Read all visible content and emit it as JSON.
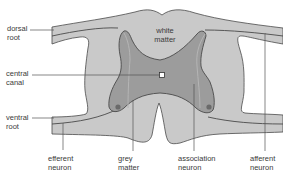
{
  "diagram": {
    "colors": {
      "background": "#ffffff",
      "white_matter": "#c9c9c9",
      "grey_matter": "#9c9c9c",
      "outline": "#4a4a4a",
      "label_text": "#3a3a3a",
      "leader_line": "#555555"
    },
    "labels": {
      "dorsal_root": {
        "line1": "dorsal",
        "line2": "root"
      },
      "central_canal": {
        "line1": "central",
        "line2": "canal"
      },
      "ventral_root": {
        "line1": "ventral",
        "line2": "root"
      },
      "white_matter": {
        "line1": "white",
        "line2": "matter"
      },
      "efferent_neuron": {
        "line1": "efferent",
        "line2": "neuron"
      },
      "grey_matter": {
        "line1": "grey",
        "line2": "matter"
      },
      "association_neuron": {
        "line1": "association",
        "line2": "neuron"
      },
      "afferent_neuron": {
        "line1": "afferent",
        "line2": "neuron"
      }
    }
  }
}
